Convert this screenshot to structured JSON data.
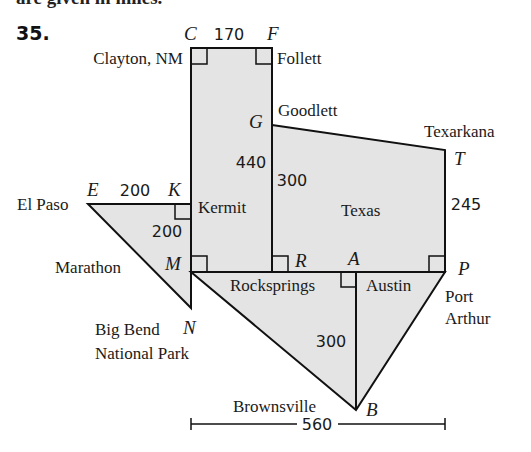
{
  "header": {
    "clipped_text": "are given in miles.",
    "problem_number": "35."
  },
  "points": {
    "C": "C",
    "F": "F",
    "G": "G",
    "T": "T",
    "E": "E",
    "K": "K",
    "M": "M",
    "R": "R",
    "A": "A",
    "P": "P",
    "N": "N",
    "B": "B"
  },
  "places": {
    "clayton": "Clayton, NM",
    "follett": "Follett",
    "goodlett": "Goodlett",
    "texarkana": "Texarkana",
    "el_paso": "El Paso",
    "kermit": "Kermit",
    "texas": "Texas",
    "marathon": "Marathon",
    "rocksprings": "Rocksprings",
    "austin": "Austin",
    "port": "Port",
    "arthur": "Arthur",
    "big_bend": "Big Bend",
    "national_park": "National Park",
    "brownsville": "Brownsville"
  },
  "distances": {
    "CF": "170",
    "EK": "200",
    "KM": "200",
    "CM": "440",
    "GR": "300",
    "TP": "245",
    "AB": "300",
    "width": "560"
  },
  "colors": {
    "fill": "#e4e4e4",
    "stroke": "#111111"
  }
}
